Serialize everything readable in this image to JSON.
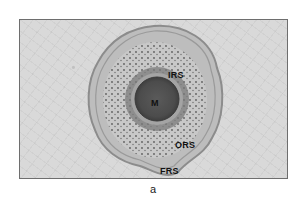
{
  "figure": {
    "panel_caption": "a",
    "labels": {
      "medulla": "M",
      "inner_root_sheath": "IRS",
      "outer_root_sheath": "ORS",
      "fibrous_root_sheath": "FRS"
    },
    "colors": {
      "background_tissue": "#d9d9d9",
      "fibrous_sheath": "#a8a8a8",
      "outer_root_sheath": "#c4c4c4",
      "inner_root_sheath": "#8a8a8a",
      "hair_shaft": "#5a5a5a",
      "medulla": "#4a4a4a"
    }
  }
}
